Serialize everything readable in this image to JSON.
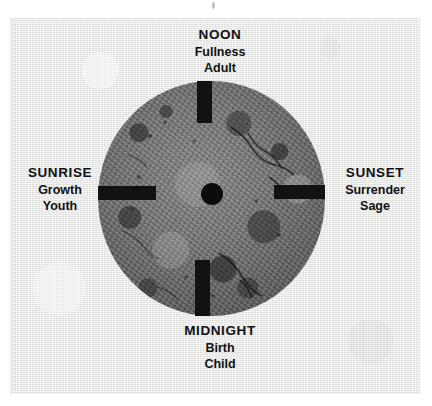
{
  "diagram": {
    "type": "cycle-wheel",
    "title": "",
    "center": {
      "marker": "hub-dot"
    },
    "quadrants": [
      {
        "position": "north",
        "title": "NOON",
        "line2": "Fullness",
        "line3": "Adult"
      },
      {
        "position": "east",
        "title": "SUNSET",
        "line2": "Surrender",
        "line3": "Sage"
      },
      {
        "position": "south",
        "title": "MIDNIGHT",
        "line2": "Birth",
        "line3": "Child"
      },
      {
        "position": "west",
        "title": "SUNRISE",
        "line2": "Growth",
        "line3": "Youth"
      }
    ],
    "colors": {
      "page": "#ffffff",
      "plate": "#e7e7e6",
      "wheel": "#6f706e",
      "spoke": "#121210",
      "hub": "#0c0c0a",
      "text": "#111111"
    }
  }
}
